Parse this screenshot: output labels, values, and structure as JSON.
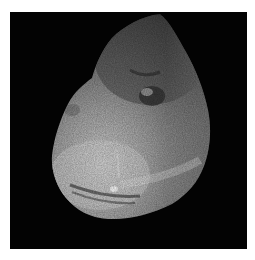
{
  "image": {
    "subject": "comet nucleus",
    "description": "Grayscale photograph of an irregular, potato-shaped comet nucleus against a black space background, lit from the lower left, with a circular crater near the top-center and a bright spot near the lower-left region",
    "background_color": "#030303",
    "border_color": "#ffffff",
    "colors": {
      "highlight": "#e6e6e6",
      "midtone": "#8a8a8a",
      "shadow": "#3a3a3a"
    }
  }
}
